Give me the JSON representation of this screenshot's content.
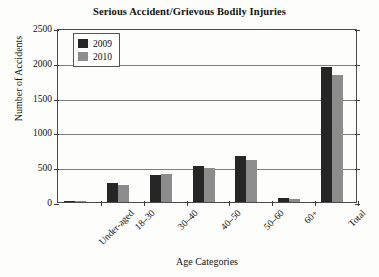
{
  "chart_data": {
    "type": "bar",
    "title": "Serious Accident/Grievous Bodily Injuries",
    "xlabel": "Age Categories",
    "ylabel": "Number of Accidents",
    "categories": [
      "Under-aged",
      "18–30",
      "30–40",
      "40–50",
      "50–60",
      "60+",
      "Total"
    ],
    "series": [
      {
        "name": "2009",
        "color": "#262626",
        "values": [
          5,
          270,
          385,
          520,
          660,
          60,
          1940
        ]
      },
      {
        "name": "2010",
        "color": "#8c8c8c",
        "values": [
          4,
          240,
          400,
          490,
          610,
          45,
          1820
        ]
      }
    ],
    "ylim": [
      0,
      2500
    ],
    "yticks": [
      0,
      500,
      1000,
      1500,
      2000,
      2500
    ],
    "ytick_labels": [
      "0",
      "500",
      "1000",
      "1500",
      "2000",
      "2500"
    ],
    "grid": true,
    "legend_position": "top-left",
    "legend_entries": [
      "2009",
      "2010"
    ]
  }
}
